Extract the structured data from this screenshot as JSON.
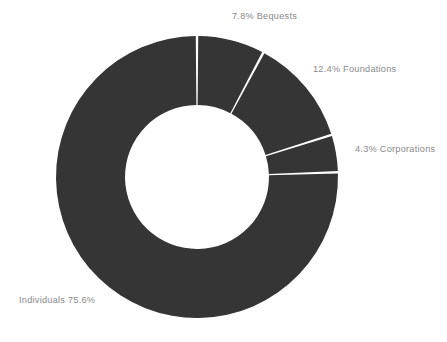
{
  "chart_data": {
    "type": "pie",
    "variant": "donut",
    "title": "",
    "subtitle": "",
    "xlabel": "",
    "ylabel": "",
    "unit": "%",
    "total": 100.1,
    "grid": false,
    "legend_position": "none",
    "label_style": "outside-direct-labels",
    "start_angle_deg": 0,
    "direction": "clockwise",
    "center": {
      "x": 197,
      "y": 177
    },
    "outer_radius": 141,
    "inner_radius": 72,
    "slice_gap_deg": 1.0,
    "colors": {
      "slice": "#353535",
      "background": "#ffffff",
      "label_text": "#8a8a8a",
      "separator": "#ffffff"
    },
    "categories": [
      "Bequests",
      "Foundations",
      "Corporations",
      "Individuals"
    ],
    "values": [
      7.8,
      12.4,
      4.3,
      75.6
    ],
    "slices": [
      {
        "name": "Bequests",
        "value": 7.8,
        "label": "7.8% Bequests",
        "color": "#353535",
        "label_position": "top"
      },
      {
        "name": "Foundations",
        "value": 12.4,
        "label": "12.4% Foundations",
        "color": "#353535",
        "label_position": "upper-right"
      },
      {
        "name": "Corporations",
        "value": 4.3,
        "label": "4.3% Corporations",
        "color": "#353535",
        "label_position": "right"
      },
      {
        "name": "Individuals",
        "value": 75.6,
        "label": "Individuals 75.6%",
        "color": "#353535",
        "label_position": "lower-left"
      }
    ]
  }
}
